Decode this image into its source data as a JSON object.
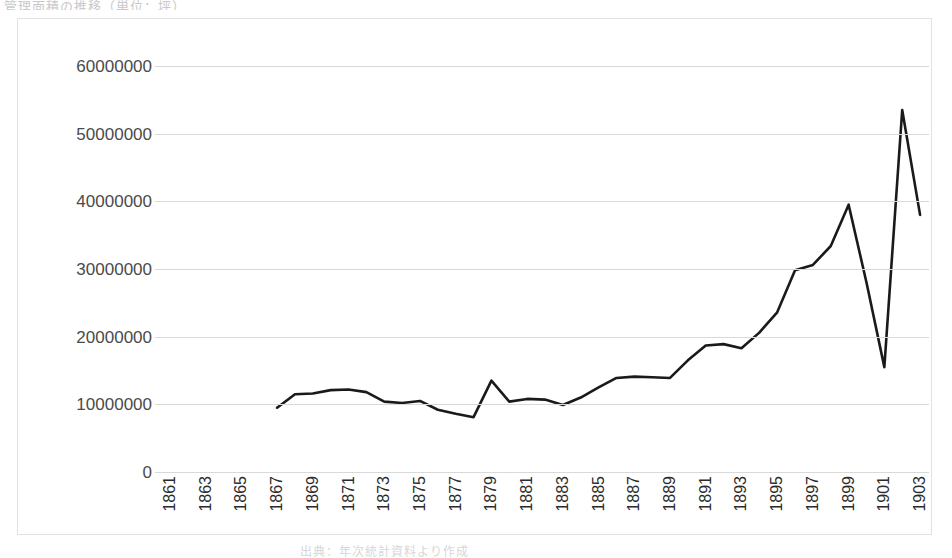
{
  "page": {
    "top_cropped_text": "管理面積の推移（単位：坪）",
    "bottom_cropped_text": "出典：年次統計資料より作成"
  },
  "chart_data": {
    "type": "line",
    "title": "",
    "subtitle": "",
    "xlabel": "",
    "ylabel": "",
    "grid": true,
    "legend": false,
    "legend_position": "none",
    "line_color": "#1a1a1a",
    "grid_color": "#d9d9d9",
    "border_color": "#e2e2e2",
    "xlim": [
      1861,
      1903
    ],
    "ylim": [
      0,
      60000000
    ],
    "ytick_labels": [
      "60000000",
      "50000000",
      "40000000",
      "30000000",
      "20000000",
      "10000000",
      "0"
    ],
    "ytick_values": [
      60000000,
      50000000,
      40000000,
      30000000,
      20000000,
      10000000,
      0
    ],
    "xtick_labels": [
      "1861",
      "1863",
      "1865",
      "1867",
      "1869",
      "1871",
      "1873",
      "1875",
      "1877",
      "1879",
      "1881",
      "1883",
      "1885",
      "1887",
      "1889",
      "1891",
      "1893",
      "1895",
      "1897",
      "1899",
      "1901",
      "1903"
    ],
    "categories": [
      1861,
      1862,
      1863,
      1864,
      1865,
      1866,
      1867,
      1868,
      1869,
      1870,
      1871,
      1872,
      1873,
      1874,
      1875,
      1876,
      1877,
      1878,
      1879,
      1880,
      1881,
      1882,
      1883,
      1884,
      1885,
      1886,
      1887,
      1888,
      1889,
      1890,
      1891,
      1892,
      1893,
      1894,
      1895,
      1896,
      1897,
      1898,
      1899,
      1900,
      1901,
      1902,
      1903
    ],
    "values": [
      null,
      null,
      null,
      null,
      null,
      null,
      9500000,
      11500000,
      11600000,
      12100000,
      12200000,
      11800000,
      10400000,
      10200000,
      10500000,
      9200000,
      8600000,
      8100000,
      13500000,
      10400000,
      10800000,
      10700000,
      9900000,
      11000000,
      12500000,
      13900000,
      14100000,
      14000000,
      13900000,
      16500000,
      18700000,
      18900000,
      18300000,
      20600000,
      23600000,
      29800000,
      30600000,
      33400000,
      39500000,
      28000000,
      15500000,
      53500000,
      38000000
    ]
  }
}
